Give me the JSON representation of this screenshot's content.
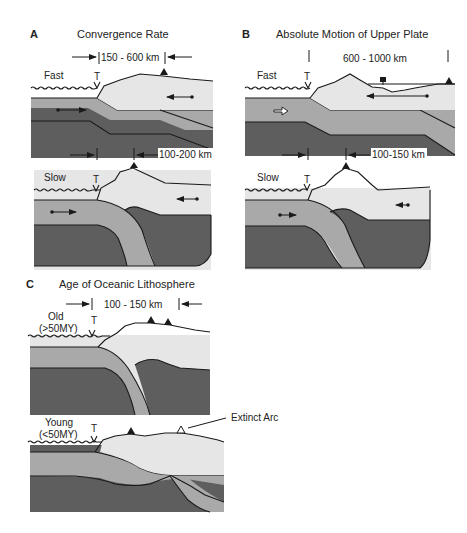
{
  "figure": {
    "panels": [
      {
        "letter": "A",
        "title": "Convergence Rate",
        "cases": [
          {
            "label": "Fast",
            "trench_label": "T",
            "dimension_top": "150 - 600 km",
            "dimension_bottom": "100-200 km"
          },
          {
            "label": "Slow",
            "trench_label": "T"
          }
        ]
      },
      {
        "letter": "B",
        "title": "Absolute Motion of Upper Plate",
        "cases": [
          {
            "label": "Fast",
            "trench_label": "T",
            "dimension_top": "600 - 1000 km",
            "dimension_bottom": "100-150 km"
          },
          {
            "label": "Slow",
            "trench_label": "T"
          }
        ]
      },
      {
        "letter": "C",
        "title": "Age of Oceanic Lithosphere",
        "cases": [
          {
            "label": "Old",
            "sublabel": "(>50MY)",
            "trench_label": "T",
            "dimension_top": "100 - 150 km"
          },
          {
            "label": "Young",
            "sublabel": "(<50MY)",
            "trench_label": "T",
            "annotation": "Extinct Arc"
          }
        ]
      }
    ],
    "legend_colors": {
      "upper_plate": "#e6e6e6",
      "oceanic_lithosphere": "#a9a9a9",
      "mantle": "#5e5e5e"
    },
    "icons": [
      "volcano-triangle-icon",
      "extinct-volcano-triangle-icon",
      "motion-arrow-icon",
      "trench-marker-icon"
    ]
  }
}
